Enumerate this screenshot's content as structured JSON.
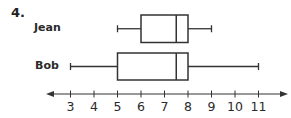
{
  "problem_number": "4.",
  "colors": {
    "stroke": "#333333",
    "text": "#2a2a2a",
    "background": "#ffffff"
  },
  "chart_data": {
    "type": "boxplot",
    "title": "",
    "xlabel": "",
    "ylabel": "",
    "orientation": "horizontal",
    "axis": {
      "min": 3,
      "max": 11,
      "ticks": [
        3,
        4,
        5,
        6,
        7,
        8,
        9,
        10,
        11
      ],
      "tick_labels": [
        "3",
        "4",
        "5",
        "6",
        "7",
        "8",
        "9",
        "10",
        "11"
      ],
      "arrows_both_ends": true
    },
    "grid": false,
    "series": [
      {
        "name": "Jean",
        "min": 5,
        "q1": 6,
        "median": 7.5,
        "q3": 8,
        "max": 9
      },
      {
        "name": "Bob",
        "min": 3,
        "q1": 5,
        "median": 7.5,
        "q3": 8,
        "max": 11
      }
    ]
  }
}
